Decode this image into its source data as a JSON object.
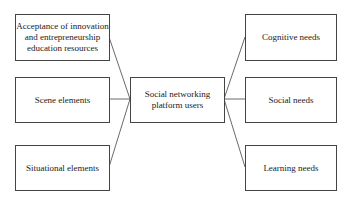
{
  "diagram": {
    "center": {
      "label": "Social networking platform users"
    },
    "left_nodes": [
      {
        "label": "Acceptance of innovation and entrepreneurship education resources"
      },
      {
        "label": "Scene elements"
      },
      {
        "label": "Situational elements"
      }
    ],
    "right_nodes": [
      {
        "label": "Cognitive needs"
      },
      {
        "label": "Social needs"
      },
      {
        "label": "Learning needs"
      }
    ],
    "line_color": "#444444"
  }
}
